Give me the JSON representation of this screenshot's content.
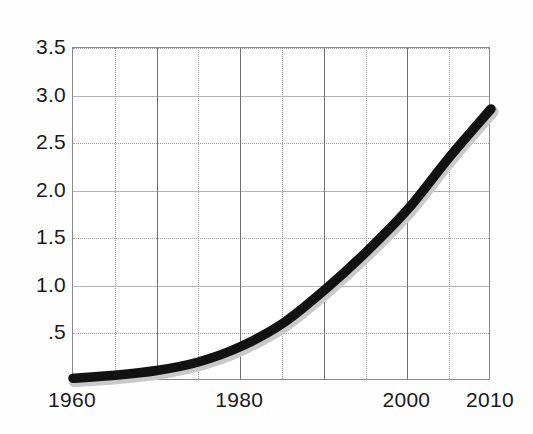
{
  "chart_data": {
    "type": "line",
    "title": "",
    "subtitle": "",
    "xlabel": "",
    "ylabel": "",
    "xlim": [
      1960,
      2010
    ],
    "ylim": [
      0,
      3.5
    ],
    "grid": true,
    "legend": null,
    "x_tick_labels": [
      "1960",
      "1980",
      "2000",
      "2010"
    ],
    "x_tick_values": [
      1960,
      1980,
      2000,
      2010
    ],
    "y_tick_labels": [
      "3.5",
      "3.0",
      "2.5",
      "2.0",
      "1.5",
      "1.0",
      ".5"
    ],
    "y_tick_values": [
      3.5,
      3.0,
      2.5,
      2.0,
      1.5,
      1.0,
      0.5
    ],
    "y_minor_step": 0.5,
    "x_minor_step": 5,
    "x_major_step": 10,
    "series": [
      {
        "name": "series-1",
        "color": "#121212",
        "x": [
          1960,
          1965,
          1970,
          1975,
          1980,
          1985,
          1990,
          1995,
          2000,
          2005,
          2010
        ],
        "values": [
          0.03,
          0.06,
          0.11,
          0.2,
          0.36,
          0.6,
          0.95,
          1.35,
          1.8,
          2.35,
          2.86
        ]
      }
    ],
    "annotations": []
  },
  "axes": {
    "y_labels": [
      "3.5",
      "3.0",
      "2.5",
      "2.0",
      "1.5",
      "1.0",
      ".5"
    ],
    "x_labels": [
      "1960",
      "1980",
      "2000",
      "2010"
    ]
  },
  "style": {
    "curve_color": "#121212",
    "grid_minor_color": "#9a9a9a",
    "grid_major_color": "#b4b4b4",
    "frame_color": "#8a8a8a",
    "background": "#ffffff",
    "text_color": "#1a1a1a"
  }
}
